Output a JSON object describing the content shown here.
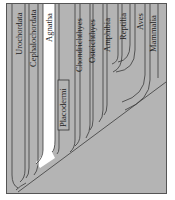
{
  "diagram": {
    "type": "cladogram",
    "background_color": "#b4b4b4",
    "line_color": "#3a3a3a",
    "highlight_color": "#ffffff",
    "taxa": [
      {
        "id": "urochordata",
        "label": "Urochordata"
      },
      {
        "id": "cephalochordata",
        "label": "Cephalochordata"
      },
      {
        "id": "agnatha",
        "label": "Agnatha",
        "highlighted": true
      },
      {
        "id": "placodermi",
        "label": "Placodermi",
        "boxed": true
      },
      {
        "id": "chondrichthyes",
        "label": "Chondrichthyes"
      },
      {
        "id": "osteichthyes",
        "label": "Osteichthyes"
      },
      {
        "id": "amphibia",
        "label": "Amphibia"
      },
      {
        "id": "reptilia",
        "label": "Reptilia"
      },
      {
        "id": "aves",
        "label": "Aves"
      },
      {
        "id": "mammalia",
        "label": "Mammalia"
      }
    ]
  }
}
